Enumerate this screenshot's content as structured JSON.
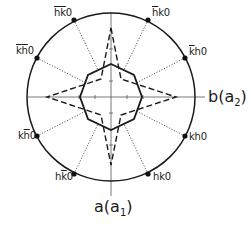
{
  "diagram": {
    "type": "polar-reflection-diagram",
    "axes": {
      "horizontal": {
        "label": "b",
        "paren": "a",
        "subscript": "2"
      },
      "vertical": {
        "label": "a",
        "paren": "a",
        "subscript": "1"
      }
    },
    "reflections": [
      {
        "id": "top-left",
        "parts": [
          {
            "t": "h",
            "bar": true
          },
          {
            "t": "k",
            "bar": true
          },
          {
            "t": "0",
            "bar": false
          }
        ]
      },
      {
        "id": "top-right",
        "parts": [
          {
            "t": "h",
            "bar": true
          },
          {
            "t": "k",
            "bar": false
          },
          {
            "t": "0",
            "bar": false
          }
        ]
      },
      {
        "id": "upper-left",
        "parts": [
          {
            "t": "k",
            "bar": true
          },
          {
            "t": "h",
            "bar": true
          },
          {
            "t": "0",
            "bar": false
          }
        ]
      },
      {
        "id": "upper-right",
        "parts": [
          {
            "t": "k",
            "bar": true
          },
          {
            "t": "h",
            "bar": false
          },
          {
            "t": "0",
            "bar": false
          }
        ]
      },
      {
        "id": "lower-left",
        "parts": [
          {
            "t": "k",
            "bar": false
          },
          {
            "t": "h",
            "bar": true
          },
          {
            "t": "0",
            "bar": false
          }
        ]
      },
      {
        "id": "lower-right",
        "parts": [
          {
            "t": "k",
            "bar": false
          },
          {
            "t": "h",
            "bar": false
          },
          {
            "t": "0",
            "bar": false
          }
        ]
      },
      {
        "id": "bottom-left",
        "parts": [
          {
            "t": "h",
            "bar": false
          },
          {
            "t": "k",
            "bar": true
          },
          {
            "t": "0",
            "bar": false
          }
        ]
      },
      {
        "id": "bottom-right",
        "parts": [
          {
            "t": "h",
            "bar": false
          },
          {
            "t": "k",
            "bar": false
          },
          {
            "t": "0",
            "bar": false
          }
        ]
      }
    ],
    "shapes": {
      "circle": "solid outer circle",
      "octagon": "solid inner octagon",
      "star": "dashed four-pointed star",
      "connectors": "dotted lines from octagon to reflection points"
    },
    "colors": {
      "ink": "#1a1a1a",
      "background": "#ffffff"
    }
  }
}
